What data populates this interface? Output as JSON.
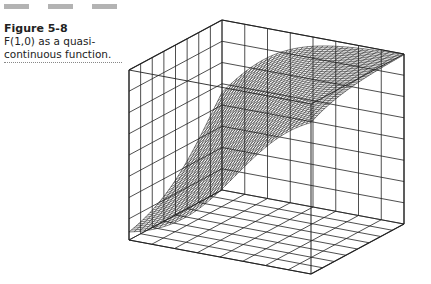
{
  "figure": {
    "number": "Figure 5-8",
    "caption_line1": "F(1,0) as a quasi-",
    "caption_line2": "continuous function."
  },
  "plot": {
    "type": "3d-surface-wireframe",
    "line_color": "#222222",
    "surface_rows": 40,
    "surface_cols": 36,
    "box_grid_divisions": 8
  }
}
